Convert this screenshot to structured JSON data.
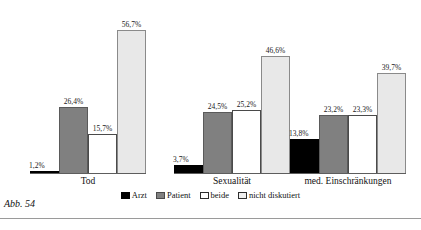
{
  "caption": "Abb. 54",
  "legend": {
    "items": [
      {
        "label": "Arzt",
        "series_key": "arzt",
        "color": "#000000"
      },
      {
        "label": "Patient",
        "series_key": "patient",
        "color": "#808080"
      },
      {
        "label": "beide",
        "series_key": "beide",
        "color": "#ffffff"
      },
      {
        "label": "nicht diskutiert",
        "series_key": "nicht",
        "color": "#e8e8e8"
      }
    ]
  },
  "chart_data": {
    "type": "bar",
    "title": "",
    "subtitle": "",
    "xlabel": "",
    "ylabel": "",
    "ylim": [
      0,
      60
    ],
    "grid": false,
    "legend_position": "bottom",
    "value_labels": true,
    "value_suffix": "%",
    "decimal_separator": ",",
    "categories": [
      "Tod",
      "Sexualität",
      "med. Einschränkungen"
    ],
    "series": [
      {
        "name": "Arzt",
        "color": "#000000",
        "values": [
          1.2,
          3.7,
          13.8
        ],
        "labels": [
          "1,2%",
          "3,7%",
          "13,8%"
        ]
      },
      {
        "name": "Patient",
        "color": "#808080",
        "values": [
          26.4,
          24.5,
          23.2
        ],
        "labels": [
          "26,4%",
          "24,5%",
          "23,2%"
        ]
      },
      {
        "name": "beide",
        "color": "#ffffff",
        "values": [
          15.7,
          25.2,
          23.3
        ],
        "labels": [
          "15,7%",
          "25,2%",
          "23,3%"
        ]
      },
      {
        "name": "nicht diskutiert",
        "color": "#e8e8e8",
        "values": [
          56.7,
          46.6,
          39.7
        ],
        "labels": [
          "56,7%",
          "46,6%",
          "39,7%"
        ]
      }
    ]
  }
}
